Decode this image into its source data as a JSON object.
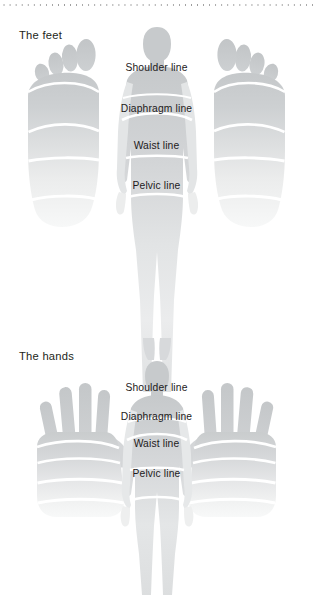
{
  "page": {
    "title_feet": "The feet",
    "title_hands": "The hands",
    "background": "#ffffff",
    "text_color": "#231f20",
    "dot_color": "#9a9a9a"
  },
  "feet_section": {
    "heading": "The feet",
    "labels": [
      {
        "text": "Shoulder line",
        "x": 164,
        "y": 68
      },
      {
        "text": "Diaphragm line",
        "x": 164,
        "y": 109
      },
      {
        "text": "Waist line",
        "x": 164,
        "y": 146
      },
      {
        "text": "Pelvic line",
        "x": 164,
        "y": 186
      }
    ],
    "left_foot_name": "left-foot-sole",
    "right_foot_name": "right-foot-sole",
    "body_name": "body-silhouette-feet"
  },
  "hands_section": {
    "heading": "The hands",
    "labels": [
      {
        "text": "Shoulder line",
        "x": 164,
        "y": 388
      },
      {
        "text": "Diaphragm line",
        "x": 164,
        "y": 416
      },
      {
        "text": "Waist line",
        "x": 164,
        "y": 443
      },
      {
        "text": "Pelvic line",
        "x": 164,
        "y": 473
      }
    ],
    "left_hand_name": "left-hand-palm",
    "right_hand_name": "right-hand-palm",
    "body_name": "body-silhouette-hands"
  },
  "palette": {
    "gray_dark": "#c9cbcc",
    "gray_mid": "#d8dadb",
    "gray_light": "#e9eaeb",
    "gray_pale": "#f4f5f5",
    "divider": "#ffffff"
  }
}
